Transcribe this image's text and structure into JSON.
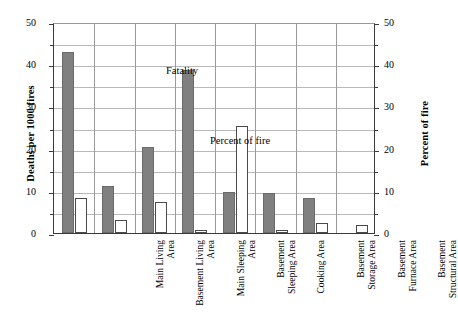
{
  "chart_data": {
    "type": "bar",
    "title": "",
    "subtitle": "",
    "xlabel": "",
    "ylabel": "Deaths per 1000 fires",
    "y2label": "Percent of fire",
    "ylim": [
      0,
      50
    ],
    "y2lim": [
      0,
      50
    ],
    "yticks": [
      0,
      10,
      20,
      30,
      40,
      50
    ],
    "y2ticks": [
      0,
      10,
      20,
      30,
      40,
      50
    ],
    "minor_tick_step": 5,
    "grid": true,
    "grid_axis": "y",
    "legend": "none",
    "annotations": [
      {
        "text": "Fatality",
        "target_series": "Fatality",
        "near_category": "Basement Sleeping Area"
      },
      {
        "text": "Percent of fire",
        "target_series": "Percent of fire",
        "near_category": "Cooking Area"
      }
    ],
    "categories": [
      "Main Living Area",
      "Basement Living Area",
      "Main Sleeping Area",
      "Basement Sleeping Area",
      "Cooking Area",
      "Basement Storage Area",
      "Basement Furnace Area",
      "Basement Structural Area"
    ],
    "category_lines": [
      [
        "Main Living",
        "Area"
      ],
      [
        "Basement Living",
        "Area"
      ],
      [
        "Main Sleeping",
        "Area"
      ],
      [
        "Basement",
        "Sleeping Area"
      ],
      [
        "Cooking Area",
        ""
      ],
      [
        "Basement",
        "Storage Area"
      ],
      [
        "Basement",
        "Furnace Area"
      ],
      [
        "Basement",
        "Structural Area"
      ]
    ],
    "series": [
      {
        "name": "Fatality",
        "axis": "left",
        "units": "Deaths per 1000 fires",
        "color": "#808080",
        "values": [
          43.0,
          11.2,
          20.3,
          38.6,
          9.8,
          9.4,
          8.2,
          0.0
        ]
      },
      {
        "name": "Percent of fire",
        "axis": "right",
        "units": "Percent of fire",
        "color": "#ffffff",
        "values": [
          8.3,
          3.0,
          7.4,
          0.8,
          25.4,
          0.6,
          2.3,
          1.9
        ]
      }
    ]
  },
  "colors": {
    "fatality_bar": "#808080",
    "percent_bar": "#ffffff",
    "bar_outline": "#4a4a4a",
    "gridline": "#b9b9b9",
    "axis": "#3a3a3a",
    "background": "#ffffff",
    "text": "#000000"
  }
}
